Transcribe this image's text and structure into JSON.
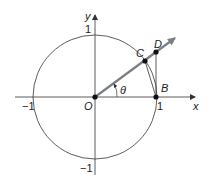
{
  "diagram": {
    "type": "unit-circle-geometry",
    "axes": {
      "x_label": "x",
      "y_label": "y",
      "tick_labels": {
        "x_pos": "1",
        "x_neg": "−1",
        "y_pos": "1",
        "y_neg": "−1"
      }
    },
    "points": {
      "origin": "O",
      "B": "B",
      "C": "C",
      "D": "D"
    },
    "angle_label": "θ",
    "colors": {
      "stroke": "#333333",
      "ray": "#7a7f86",
      "point": "#111111"
    }
  }
}
